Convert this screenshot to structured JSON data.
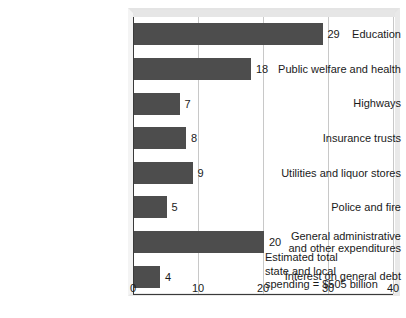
{
  "chart_data": {
    "type": "bar",
    "orientation": "horizontal",
    "title": "",
    "subtitle": "",
    "xlabel": "",
    "ylabel": "",
    "xlim": [
      0,
      40
    ],
    "xticks": [
      0,
      10,
      20,
      30,
      40
    ],
    "xtick_labels": [
      "0",
      "10",
      "20",
      "30",
      "40"
    ],
    "grid": true,
    "grid_axis": "x",
    "legend": false,
    "legend_position": "none",
    "bar_color": "#4d4d4d",
    "gridline_color": "#c8c8c8",
    "axis_color": "#3a3a3a",
    "categories": [
      "Education",
      "Public welfare and health",
      "Highways",
      "Insurance trusts",
      "Utilities and liquor stores",
      "Police and fire",
      "General administrative\nand other expenditures",
      "Interest on general debt"
    ],
    "values": [
      29,
      18,
      7,
      8,
      9,
      5,
      20,
      4
    ],
    "value_labels": [
      "29",
      "18",
      "7",
      "8",
      "9",
      "5",
      "20",
      "4"
    ],
    "annotations": [
      {
        "name": "total-spending-note",
        "text": "Estimated total\nstate and local\nspending  =  $505 billion"
      }
    ]
  }
}
